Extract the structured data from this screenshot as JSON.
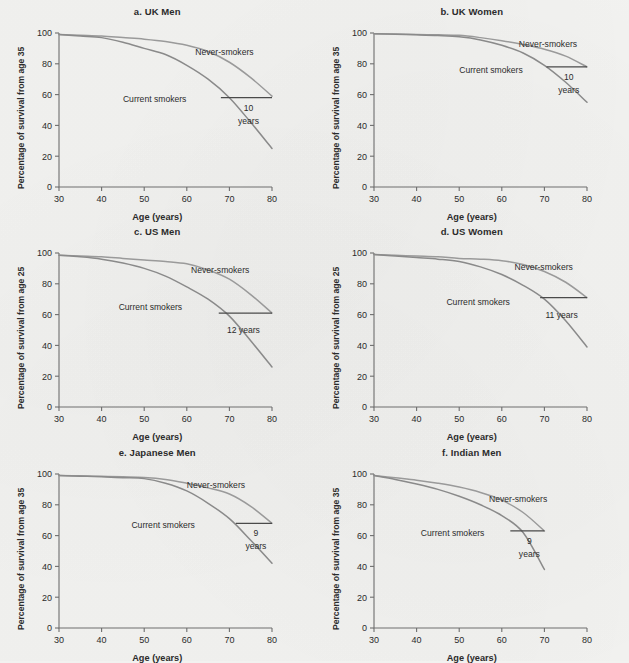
{
  "figure": {
    "background_color": "#f2f2f0",
    "axis_color": "#6e6e6e",
    "never_smokers_color": "#9a9a9a",
    "current_smokers_color": "#8a8a8a",
    "gap_line_color": "#4a4a4a",
    "xlabel": "Age (years)",
    "x_ticks": [
      30,
      40,
      50,
      60,
      70,
      80
    ],
    "y_ticks": [
      0,
      20,
      40,
      60,
      80,
      100
    ],
    "never_smokers_label": "Never-smokers",
    "current_smokers_label": "Current smokers"
  },
  "panels": [
    {
      "id": "a",
      "title": "a. UK Men",
      "ylabel": "Percentage of survival from age 35",
      "gap_label_line1": "10",
      "gap_label_line2": "years",
      "gap_label_single": "",
      "gap_level": 58,
      "gap_x_start": 68,
      "gap_x_end": 80,
      "never_label_x": 62,
      "never_label_y": 86,
      "current_label_x": 45,
      "current_label_y": 55
    },
    {
      "id": "b",
      "title": "b. UK Women",
      "ylabel": "Percentage of survival from age 35",
      "gap_label_line1": "10",
      "gap_label_line2": "years",
      "gap_label_single": "",
      "gap_level": 78,
      "gap_x_start": 70.5,
      "gap_x_end": 80,
      "never_label_x": 64,
      "never_label_y": 91,
      "current_label_x": 50,
      "current_label_y": 74
    },
    {
      "id": "c",
      "title": "c. US Men",
      "ylabel": "Percentage of survival from age 25",
      "gap_label_line1": "",
      "gap_label_line2": "",
      "gap_label_single": "12 years",
      "gap_level": 61,
      "gap_x_start": 67.5,
      "gap_x_end": 80,
      "never_label_x": 61,
      "never_label_y": 87,
      "current_label_x": 44,
      "current_label_y": 63
    },
    {
      "id": "d",
      "title": "d. US Women",
      "ylabel": "Percentage of survival from age 25",
      "gap_label_line1": "",
      "gap_label_line2": "",
      "gap_label_single": "11 years",
      "gap_level": 71,
      "gap_x_start": 69,
      "gap_x_end": 80,
      "never_label_x": 63,
      "never_label_y": 89,
      "current_label_x": 47,
      "current_label_y": 66
    },
    {
      "id": "e",
      "title": "e. Japanese Men",
      "ylabel": "Percentage of survival from age 35",
      "gap_label_line1": "9",
      "gap_label_line2": "years",
      "gap_label_single": "",
      "gap_level": 68,
      "gap_x_start": 71.5,
      "gap_x_end": 80,
      "never_label_x": 60,
      "never_label_y": 91,
      "current_label_x": 47,
      "current_label_y": 65
    },
    {
      "id": "f",
      "title": "f. Indian Men",
      "ylabel": "Percentage of survival from age 35",
      "gap_label_line1": "9",
      "gap_label_line2": "years",
      "gap_label_single": "",
      "gap_level": 63,
      "gap_x_start": 62,
      "gap_x_end": 70,
      "never_label_x": 57,
      "never_label_y": 82,
      "current_label_x": 41,
      "current_label_y": 60
    }
  ],
  "chart_data": {
    "type": "line",
    "xlabel": "Age (years)",
    "ylabel": "Percentage of survival",
    "xlim": [
      30,
      80
    ],
    "ylim": [
      0,
      100
    ],
    "grid": false,
    "legend_position": "inline annotations",
    "x": [
      30,
      35,
      40,
      45,
      50,
      55,
      60,
      65,
      70,
      75,
      80
    ],
    "panels": [
      {
        "id": "a",
        "label": "a. UK Men",
        "ylabel": "Percentage of survival from age 35",
        "survival_gap_years": 10,
        "gap_annotation": "10 years",
        "series": [
          {
            "name": "Never-smokers",
            "values": [
              99,
              98.5,
              98,
              97,
              96,
              94.5,
              92,
              88,
              81,
              71,
              59
            ]
          },
          {
            "name": "Current smokers",
            "values": [
              99,
              98,
              97,
              94,
              90,
              86,
              79,
              70,
              58,
              42,
              25
            ]
          }
        ]
      },
      {
        "id": "b",
        "label": "b. UK Women",
        "ylabel": "Percentage of survival from age 35",
        "survival_gap_years": 10,
        "gap_annotation": "10 years",
        "series": [
          {
            "name": "Never-smokers",
            "values": [
              99.5,
              99.3,
              99,
              98.8,
              98.5,
              97,
              95,
              92.5,
              89.5,
              85,
              78
            ]
          },
          {
            "name": "Current smokers",
            "values": [
              99.5,
              99.2,
              98.8,
              98.3,
              97.5,
              95.5,
              92,
              87,
              79,
              68,
              55
            ]
          }
        ]
      },
      {
        "id": "c",
        "label": "c. US Men",
        "ylabel": "Percentage of survival from age 25",
        "survival_gap_years": 12,
        "gap_annotation": "12 years",
        "series": [
          {
            "name": "Never-smokers",
            "values": [
              98.5,
              98,
              97.5,
              96.5,
              95.5,
              94.5,
              93,
              89,
              83,
              73,
              61
            ]
          },
          {
            "name": "Current smokers",
            "values": [
              98.5,
              97.5,
              96,
              93.5,
              90,
              85,
              78,
              70,
              59,
              43,
              26
            ]
          }
        ]
      },
      {
        "id": "d",
        "label": "d. US Women",
        "ylabel": "Percentage of survival from age 25",
        "survival_gap_years": 11,
        "gap_annotation": "11 years",
        "series": [
          {
            "name": "Never-smokers",
            "values": [
              99,
              98.5,
              98,
              97.5,
              96.5,
              96,
              95,
              92.5,
              88,
              81,
              71
            ]
          },
          {
            "name": "Current smokers",
            "values": [
              99,
              98,
              97,
              96,
              94.5,
              91,
              86,
              79,
              70,
              56,
              39
            ]
          }
        ]
      },
      {
        "id": "e",
        "label": "e. Japanese Men",
        "ylabel": "Percentage of survival from age 35",
        "survival_gap_years": 9,
        "gap_annotation": "9 years",
        "series": [
          {
            "name": "Never-smokers",
            "values": [
              99,
              98.8,
              98.5,
              98.2,
              97.8,
              96.5,
              94,
              91,
              87,
              79,
              68
            ]
          },
          {
            "name": "Current smokers",
            "values": [
              99,
              98.6,
              98.2,
              97.6,
              97,
              94,
              89,
              81,
              71,
              57,
              42
            ]
          }
        ]
      },
      {
        "id": "f",
        "label": "f. Indian Men",
        "ylabel": "Percentage of survival from age 35",
        "survival_gap_years": 9,
        "gap_annotation": "9 years",
        "series": [
          {
            "name": "Never-smokers",
            "values": [
              99,
              97.5,
              96,
              94,
              91.5,
              88,
              83,
              75,
              63,
              null,
              null
            ]
          },
          {
            "name": "Current smokers",
            "values": [
              99,
              96.5,
              93.5,
              90,
              85.5,
              80,
              73,
              62,
              38,
              null,
              null
            ]
          }
        ]
      }
    ]
  }
}
